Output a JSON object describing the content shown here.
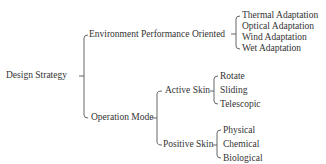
{
  "diagram": {
    "root": "Design Strategy",
    "branches": [
      {
        "label": "Environment Performance Oriented",
        "children": [
          "Thermal Adaptation",
          "Optical Adaptation",
          "Wind Adaptation",
          "Wet Adaptation"
        ]
      },
      {
        "label": "Operation Mode",
        "children": [
          {
            "label": "Active Skin",
            "children": [
              "Rotate",
              "Sliding",
              "Telescopic"
            ]
          },
          {
            "label": "Positive Skin",
            "children": [
              "Physical",
              "Chemical",
              "Biological"
            ]
          }
        ]
      }
    ],
    "line_color": "#555555",
    "text_color": "#333333"
  }
}
